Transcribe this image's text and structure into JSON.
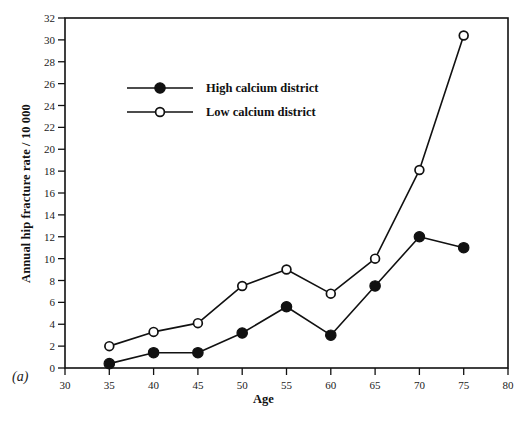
{
  "figure": {
    "panel_tag": "(a)"
  },
  "chart_data": {
    "type": "line",
    "title": "",
    "xlabel": "Age",
    "ylabel": "Annual hip fracture rate / 10 000",
    "x": [
      35,
      40,
      45,
      50,
      55,
      60,
      65,
      70,
      75
    ],
    "xlim": [
      30,
      80
    ],
    "ylim": [
      0,
      32
    ],
    "xticks": [
      30,
      35,
      40,
      45,
      50,
      55,
      60,
      65,
      70,
      75,
      80
    ],
    "yticks": [
      0,
      2,
      4,
      6,
      8,
      10,
      12,
      14,
      16,
      18,
      20,
      22,
      24,
      26,
      28,
      30,
      32
    ],
    "grid": false,
    "legend_position": "upper-left-inside",
    "series": [
      {
        "name": "High calcium district",
        "marker": "filled-circle",
        "color": "#111111",
        "values": [
          0.4,
          1.4,
          1.4,
          3.2,
          5.6,
          3.0,
          7.5,
          12.0,
          11.0
        ]
      },
      {
        "name": "Low calcium district",
        "marker": "open-circle",
        "color": "#111111",
        "values": [
          2.0,
          3.3,
          4.1,
          7.5,
          9.0,
          6.8,
          10.0,
          18.1,
          30.4
        ]
      }
    ]
  }
}
